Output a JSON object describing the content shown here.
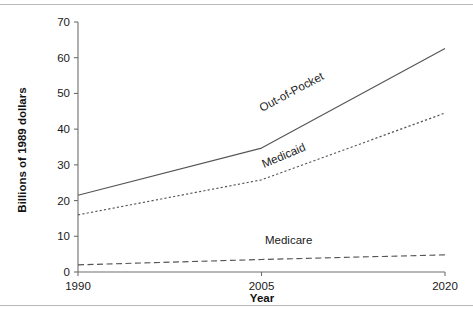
{
  "chart_data": {
    "type": "line",
    "title": "",
    "subtitle": "",
    "xlabel": "Year",
    "ylabel": "Billions of 1989 dollars",
    "x": [
      1990,
      2005,
      2020
    ],
    "xlim": [
      1990,
      2020
    ],
    "ylim": [
      0,
      70
    ],
    "xticks": [
      "1990",
      "2005",
      "2020"
    ],
    "yticks": [
      "0",
      "10",
      "20",
      "30",
      "40",
      "50",
      "60",
      "70"
    ],
    "ytick_values": [
      0,
      10,
      20,
      30,
      40,
      50,
      60,
      70
    ],
    "grid": false,
    "legend_position": "inline-labels",
    "series": [
      {
        "name": "Out-of-Pocket",
        "style": "solid",
        "label_rotation": -28,
        "values": [
          21.5,
          34.7,
          62.6
        ]
      },
      {
        "name": "Medicaid",
        "style": "dotted",
        "label_rotation": -23,
        "values": [
          16.0,
          25.8,
          44.5
        ]
      },
      {
        "name": "Medicare",
        "style": "dashed",
        "label_rotation": 0,
        "values": [
          2.0,
          3.5,
          4.8
        ]
      }
    ],
    "annotations": [
      {
        "text": "Out-of-Pocket",
        "series": "Out-of-Pocket"
      },
      {
        "text": "Medicaid",
        "series": "Medicaid"
      },
      {
        "text": "Medicare",
        "series": "Medicare"
      }
    ],
    "colors": {
      "line": "#555555",
      "axis": "#6e6e6e",
      "text": "#1a1a1a",
      "background": "#ffffff",
      "rule": "#b9b9b9"
    }
  }
}
